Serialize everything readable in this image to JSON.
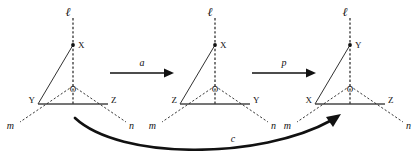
{
  "figure": {
    "background_color": "#ffffff",
    "ink_color": "#111111"
  },
  "diagrams": [
    {
      "id": "diagram-1",
      "axis_label": "ℓ",
      "apex_label": "X",
      "center_label": "O",
      "bottom_left_label": "Y",
      "bottom_right_label": "Z",
      "left_ray_label": "m",
      "right_ray_label": "n"
    },
    {
      "id": "diagram-2",
      "axis_label": "ℓ",
      "apex_label": "X",
      "center_label": "O",
      "bottom_left_label": "Z",
      "bottom_right_label": "Y",
      "left_ray_label": "m",
      "right_ray_label": "n"
    },
    {
      "id": "diagram-3",
      "axis_label": "ℓ",
      "apex_label": "Y",
      "center_label": "O",
      "bottom_left_label": "X",
      "bottom_right_label": "Z",
      "left_ray_label": "m",
      "right_ray_label": "n"
    }
  ],
  "arrows": [
    {
      "id": "arrow-a",
      "label": "a",
      "kind": "straight"
    },
    {
      "id": "arrow-p",
      "label": "p",
      "kind": "straight"
    },
    {
      "id": "arrow-c",
      "label": "c",
      "kind": "curved"
    }
  ]
}
